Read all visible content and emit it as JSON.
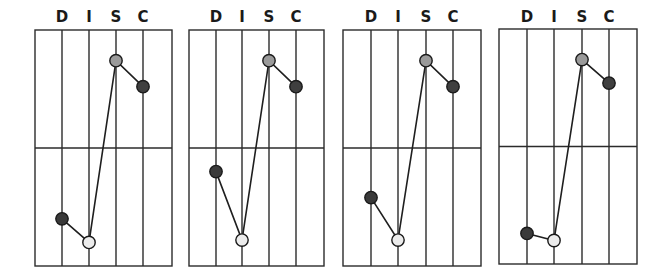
{
  "chart_data": [
    {
      "type": "line",
      "title": "",
      "categories": [
        "D",
        "I",
        "S",
        "C"
      ],
      "values": [
        20,
        10,
        87,
        76
      ],
      "ylim": [
        0,
        100
      ],
      "grid": true,
      "xlabel": "",
      "ylabel": ""
    },
    {
      "type": "line",
      "title": "",
      "categories": [
        "D",
        "I",
        "S",
        "C"
      ],
      "values": [
        40,
        11,
        87,
        76
      ],
      "ylim": [
        0,
        100
      ],
      "grid": true,
      "xlabel": "",
      "ylabel": ""
    },
    {
      "type": "line",
      "title": "",
      "categories": [
        "D",
        "I",
        "S",
        "C"
      ],
      "values": [
        29,
        11,
        87,
        76
      ],
      "ylim": [
        0,
        100
      ],
      "grid": true,
      "xlabel": "",
      "ylabel": ""
    },
    {
      "type": "line",
      "title": "",
      "categories": [
        "D",
        "I",
        "S",
        "C"
      ],
      "values": [
        13,
        10,
        87,
        77
      ],
      "ylim": [
        0,
        100
      ],
      "grid": true,
      "xlabel": "",
      "ylabel": ""
    }
  ],
  "colors": {
    "D": "#3a3a3a",
    "I": "#ececec",
    "S": "#9a9a9a",
    "C": "#3f3f3f",
    "grid": "#2b2b2b"
  },
  "layout": [
    {
      "left": 35,
      "right": 172,
      "top": 30,
      "bottom": 266,
      "cols": [
        62,
        89,
        116,
        143
      ]
    },
    {
      "left": 189,
      "right": 324,
      "top": 30,
      "bottom": 266,
      "cols": [
        216,
        242,
        269,
        296
      ]
    },
    {
      "left": 343,
      "right": 481,
      "top": 30,
      "bottom": 266,
      "cols": [
        371,
        398,
        426,
        453
      ]
    },
    {
      "left": 499,
      "right": 637,
      "top": 29,
      "bottom": 264,
      "cols": [
        527,
        554,
        582,
        609
      ]
    }
  ]
}
